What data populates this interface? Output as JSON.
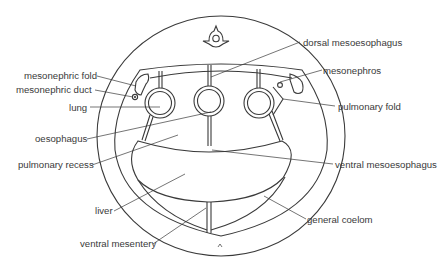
{
  "diagram": {
    "colors": {
      "line": "#3a3a3a",
      "stipple": "#b8b8b8",
      "background": "#ffffff"
    },
    "labels": {
      "mesonephric_fold": "mesonephric fold",
      "mesonephric_duct": "mesonephric duct",
      "lung": "lung",
      "oesophagus": "oesophagus",
      "pulmonary_recess": "pulmonary recess",
      "liver": "liver",
      "ventral_mesentery": "ventral mesentery",
      "dorsal_mesoesophagus": "dorsal mesoesophagus",
      "mesonephros": "mesonephros",
      "pulmonary_fold": "pulmonary fold",
      "ventral_mesoesophagus": "ventral mesoesophagus",
      "general_coelom": "general coelom"
    }
  }
}
